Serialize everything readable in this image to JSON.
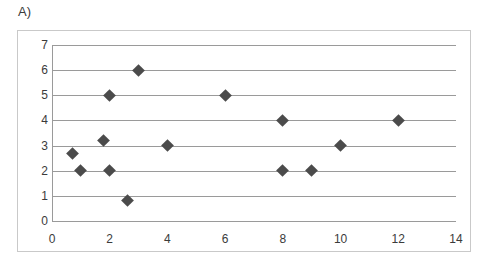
{
  "figure": {
    "panel_label": "A)"
  },
  "chart_data": {
    "type": "scatter",
    "title": "A)",
    "xlabel": "",
    "ylabel": "",
    "xlim": [
      0,
      14
    ],
    "ylim": [
      0,
      7
    ],
    "grid": true,
    "legend": false,
    "marker": "diamond",
    "marker_color": "#4b4b4b",
    "gridline_color": "#9a9a9a",
    "border_color": "#c9c9c9",
    "xticks": [
      0,
      2,
      4,
      6,
      8,
      10,
      12,
      14
    ],
    "xtick_labels": [
      "0",
      "2",
      "4",
      "6",
      "8",
      "10",
      "12",
      "14"
    ],
    "yticks": [
      0,
      1,
      2,
      3,
      4,
      5,
      6,
      7
    ],
    "ytick_labels": [
      "0",
      "1",
      "2",
      "3",
      "4",
      "5",
      "6",
      "7"
    ],
    "points": [
      {
        "x": 0.7,
        "y": 2.7
      },
      {
        "x": 1.0,
        "y": 2.0
      },
      {
        "x": 1.8,
        "y": 3.2
      },
      {
        "x": 2.0,
        "y": 5.0
      },
      {
        "x": 2.0,
        "y": 2.0
      },
      {
        "x": 2.6,
        "y": 0.8
      },
      {
        "x": 3.0,
        "y": 6.0
      },
      {
        "x": 4.0,
        "y": 3.0
      },
      {
        "x": 6.0,
        "y": 5.0
      },
      {
        "x": 8.0,
        "y": 4.0
      },
      {
        "x": 8.0,
        "y": 2.0
      },
      {
        "x": 9.0,
        "y": 2.0
      },
      {
        "x": 10.0,
        "y": 3.0
      },
      {
        "x": 12.0,
        "y": 4.0
      }
    ]
  }
}
